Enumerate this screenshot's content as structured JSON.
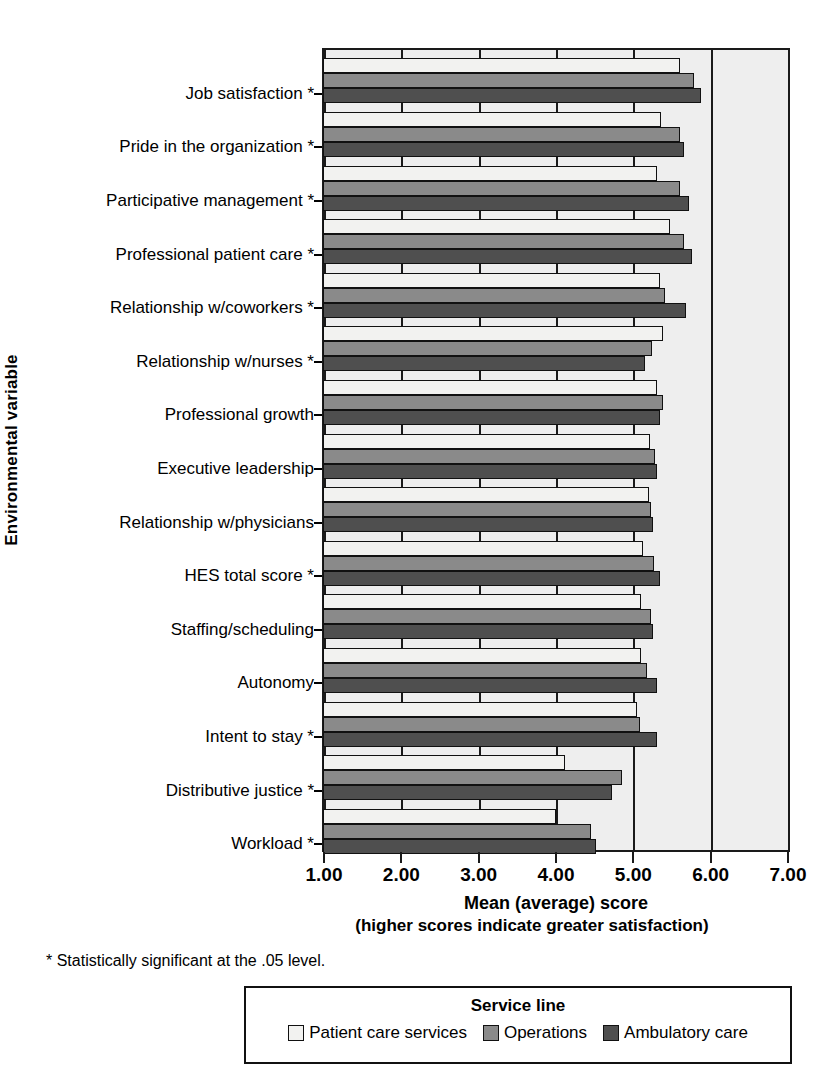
{
  "chart_data": {
    "type": "bar",
    "orientation": "horizontal",
    "title": "",
    "xlabel": "Mean (average) score",
    "xlabel_sub": "(higher scores indicate greater satisfaction)",
    "ylabel": "Environmental variable",
    "xlim": [
      1.0,
      7.0
    ],
    "xticks": [
      1.0,
      2.0,
      3.0,
      4.0,
      5.0,
      6.0,
      7.0
    ],
    "xticklabels": [
      "1.00",
      "2.00",
      "3.00",
      "4.00",
      "5.00",
      "6.00",
      "7.00"
    ],
    "grid": true,
    "legend_position": "bottom",
    "legend_title": "Service line",
    "footnote": "* Statistically significant at the .05 level.",
    "categories": [
      "Job satisfaction *",
      "Pride in the organization *",
      "Participative management *",
      "Professional patient care *",
      "Relationship w/coworkers *",
      "Relationship w/nurses *",
      "Professional growth",
      "Executive leadership",
      "Relationship w/physicians",
      "HES total score *",
      "Staffing/scheduling",
      "Autonomy",
      "Intent to stay *",
      "Distributive justice *",
      "Workload *"
    ],
    "series": [
      {
        "name": "Patient care services",
        "color": "#f2f2f0",
        "values": [
          5.6,
          5.36,
          5.3,
          5.47,
          5.35,
          5.38,
          5.3,
          5.22,
          5.2,
          5.12,
          5.1,
          5.1,
          5.05,
          4.12,
          4.0
        ]
      },
      {
        "name": "Operations",
        "color": "#8a8a8a",
        "values": [
          5.78,
          5.6,
          5.6,
          5.66,
          5.41,
          5.24,
          5.38,
          5.28,
          5.23,
          5.27,
          5.23,
          5.18,
          5.08,
          4.85,
          4.45
        ]
      },
      {
        "name": "Ambulatory care",
        "color": "#4f4f4f",
        "values": [
          5.88,
          5.65,
          5.72,
          5.76,
          5.68,
          5.15,
          5.35,
          5.3,
          5.26,
          5.35,
          5.25,
          5.3,
          5.3,
          4.72,
          4.52
        ]
      }
    ]
  }
}
